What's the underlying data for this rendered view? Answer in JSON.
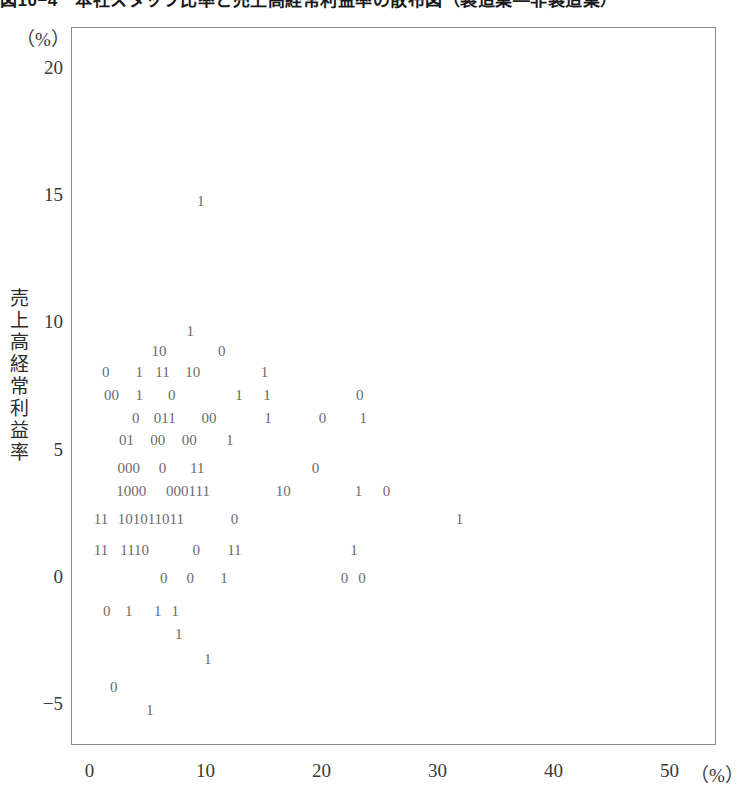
{
  "figure": {
    "title": "図10−4　本社スタッフ比率と売上高経常利益率の散布図（製造業―非製造業）",
    "y_unit": "（%）",
    "x_unit": "（%）",
    "y_axis_title_chars": [
      "売",
      "上",
      "高",
      "経",
      "常",
      "利",
      "益",
      "率"
    ]
  },
  "chart_data": {
    "type": "scatter",
    "title": "図10−4　本社スタッフ比率と売上高経常利益率の散布図（製造業―非製造業）",
    "xlabel": "本社スタッフ比率 （%）",
    "ylabel": "売上高経常利益率 （%）",
    "xlim": [
      -1.6,
      54.0
    ],
    "ylim": [
      -6.6,
      21.6
    ],
    "xticks": [
      "0",
      "10",
      "20",
      "30",
      "40",
      "50"
    ],
    "xtick_values": [
      0,
      10,
      20,
      30,
      40,
      50
    ],
    "yticks": [
      "20",
      "15",
      "10",
      "5",
      "0",
      "-5"
    ],
    "ytick_values": [
      20,
      15,
      10,
      5,
      0,
      -5
    ],
    "grid": false,
    "legend": null,
    "marker_legend": {
      "0": "製造業",
      "1": "非製造業"
    },
    "note": "Each plotted marker is the digit 0 or 1 denoting industry group.",
    "rows": [
      {
        "y": 14.8,
        "markers": [
          {
            "x": 9.5,
            "label": "1"
          }
        ]
      },
      {
        "y": 9.7,
        "markers": [
          {
            "x": 8.6,
            "label": "1"
          }
        ]
      },
      {
        "y": 8.9,
        "markers": [
          {
            "x": 5.9,
            "label": "10"
          },
          {
            "x": 11.3,
            "label": "0"
          }
        ]
      },
      {
        "y": 8.1,
        "markers": [
          {
            "x": 1.3,
            "label": "0"
          },
          {
            "x": 4.2,
            "label": "1"
          },
          {
            "x": 6.2,
            "label": "11"
          },
          {
            "x": 8.8,
            "label": "10"
          },
          {
            "x": 15.0,
            "label": "1"
          }
        ]
      },
      {
        "y": 7.2,
        "markers": [
          {
            "x": 1.8,
            "label": "00"
          },
          {
            "x": 4.2,
            "label": "1"
          },
          {
            "x": 7.0,
            "label": "0"
          },
          {
            "x": 12.8,
            "label": "1"
          },
          {
            "x": 15.2,
            "label": "1"
          },
          {
            "x": 23.2,
            "label": "0"
          }
        ]
      },
      {
        "y": 6.3,
        "markers": [
          {
            "x": 3.9,
            "label": "0"
          },
          {
            "x": 6.4,
            "label": "011"
          },
          {
            "x": 10.2,
            "label": "00"
          },
          {
            "x": 15.3,
            "label": "1"
          },
          {
            "x": 20.0,
            "label": "0"
          },
          {
            "x": 23.5,
            "label": "1"
          }
        ]
      },
      {
        "y": 5.4,
        "markers": [
          {
            "x": 3.1,
            "label": "01"
          },
          {
            "x": 5.8,
            "label": "00"
          },
          {
            "x": 8.5,
            "label": "00"
          },
          {
            "x": 12.0,
            "label": "1"
          }
        ]
      },
      {
        "y": 4.3,
        "markers": [
          {
            "x": 3.3,
            "label": "000"
          },
          {
            "x": 6.2,
            "label": "0"
          },
          {
            "x": 9.2,
            "label": "11"
          },
          {
            "x": 19.4,
            "label": "0"
          }
        ]
      },
      {
        "y": 3.4,
        "markers": [
          {
            "x": 3.5,
            "label": "1000"
          },
          {
            "x": 8.4,
            "label": "000111"
          },
          {
            "x": 16.6,
            "label": "10"
          },
          {
            "x": 23.1,
            "label": "1"
          },
          {
            "x": 25.5,
            "label": "0"
          }
        ]
      },
      {
        "y": 2.3,
        "markers": [
          {
            "x": 0.9,
            "label": "11"
          },
          {
            "x": 5.2,
            "label": "101011011"
          },
          {
            "x": 12.4,
            "label": "0"
          },
          {
            "x": 31.8,
            "label": "1"
          }
        ]
      },
      {
        "y": 1.1,
        "markers": [
          {
            "x": 0.9,
            "label": "11"
          },
          {
            "x": 3.8,
            "label": "1110"
          },
          {
            "x": 9.1,
            "label": "0"
          },
          {
            "x": 12.4,
            "label": "11"
          },
          {
            "x": 22.7,
            "label": "1"
          }
        ]
      },
      {
        "y": 0.0,
        "markers": [
          {
            "x": 6.3,
            "label": "0"
          },
          {
            "x": 8.6,
            "label": "0"
          },
          {
            "x": 11.5,
            "label": "1"
          },
          {
            "x": 21.9,
            "label": "0"
          },
          {
            "x": 23.4,
            "label": "0"
          }
        ]
      },
      {
        "y": -1.3,
        "markers": [
          {
            "x": 1.4,
            "label": "0"
          },
          {
            "x": 3.3,
            "label": "1"
          },
          {
            "x": 5.8,
            "label": "1"
          },
          {
            "x": 7.3,
            "label": "1"
          }
        ]
      },
      {
        "y": -2.2,
        "markers": [
          {
            "x": 7.6,
            "label": "1"
          }
        ]
      },
      {
        "y": -3.2,
        "markers": [
          {
            "x": 10.1,
            "label": "1"
          }
        ]
      },
      {
        "y": -4.3,
        "markers": [
          {
            "x": 2.0,
            "label": "0"
          }
        ]
      },
      {
        "y": -5.2,
        "markers": [
          {
            "x": 5.1,
            "label": "1"
          }
        ]
      }
    ]
  }
}
